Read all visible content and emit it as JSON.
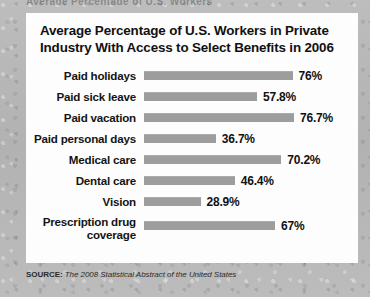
{
  "bleed_text": "Average Percentage of U.S. Workers",
  "card": {
    "title_line1": "Average Percentage of U.S. Workers in Private",
    "title_line2": "Industry With Access to Select Benefits in 2006"
  },
  "source": {
    "prefix": "SOURCE:",
    "publication": "The 2008 Statistical Abstract of the United States"
  },
  "colors": {
    "bar": "#9d9d9d",
    "card_background": "#fdfdfd",
    "page_background": "#b5b5b5",
    "text": "#111111"
  },
  "chart_data": {
    "type": "bar",
    "orientation": "horizontal",
    "title": "Average Percentage of U.S. Workers in Private Industry With Access to Select Benefits in 2006",
    "xlabel": "",
    "ylabel": "",
    "xlim": [
      0,
      80
    ],
    "grid": false,
    "legend": false,
    "source": "The 2008 Statistical Abstract of the United States",
    "categories": [
      "Paid holidays",
      "Paid sick leave",
      "Paid vacation",
      "Paid personal days",
      "Medical care",
      "Dental care",
      "Vision",
      "Prescription drug coverage"
    ],
    "values": [
      76,
      57.8,
      76.7,
      36.7,
      70.2,
      46.4,
      28.9,
      67
    ],
    "value_labels": [
      "76%",
      "57.8%",
      "76.7%",
      "36.7%",
      "70.2%",
      "46.4%",
      "28.9%",
      "67%"
    ]
  },
  "rows": [
    {
      "label": "Paid holidays",
      "label2": "",
      "value": 76,
      "value_label": "76%"
    },
    {
      "label": "Paid sick leave",
      "label2": "",
      "value": 57.8,
      "value_label": "57.8%"
    },
    {
      "label": "Paid vacation",
      "label2": "",
      "value": 76.7,
      "value_label": "76.7%"
    },
    {
      "label": "Paid personal days",
      "label2": "",
      "value": 36.7,
      "value_label": "36.7%"
    },
    {
      "label": "Medical care",
      "label2": "",
      "value": 70.2,
      "value_label": "70.2%"
    },
    {
      "label": "Dental care",
      "label2": "",
      "value": 46.4,
      "value_label": "46.4%"
    },
    {
      "label": "Vision",
      "label2": "",
      "value": 28.9,
      "value_label": "28.9%"
    },
    {
      "label": "Prescription drug",
      "label2": "coverage",
      "value": 67,
      "value_label": "67%"
    }
  ]
}
